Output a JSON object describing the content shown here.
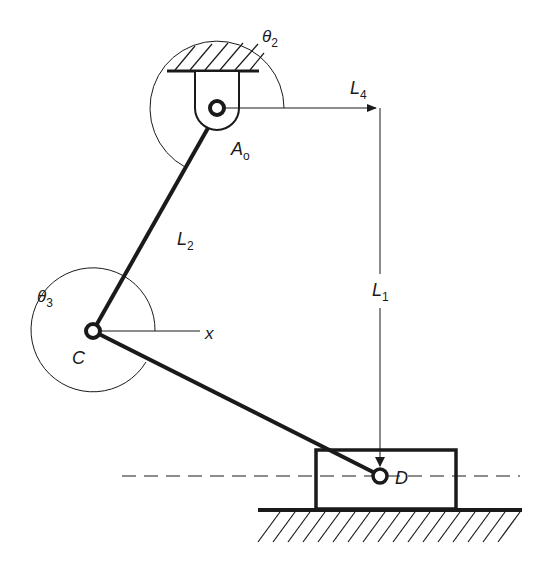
{
  "diagram": {
    "type": "slider-crank mechanism",
    "colors": {
      "ink": "#1a1a1a",
      "background": "#ffffff"
    },
    "points": {
      "A0": {
        "label": "A",
        "subscript": "o"
      },
      "C": {
        "label": "C"
      },
      "D": {
        "label": "D"
      }
    },
    "links": {
      "L1": {
        "label": "L",
        "subscript": "1"
      },
      "L2": {
        "label": "L",
        "subscript": "2"
      },
      "L4": {
        "label": "L",
        "subscript": "4"
      }
    },
    "angles": {
      "theta2": {
        "label": "θ",
        "subscript": "2"
      },
      "theta3": {
        "label": "θ",
        "subscript": "3"
      }
    },
    "axis": {
      "label": "x"
    }
  }
}
